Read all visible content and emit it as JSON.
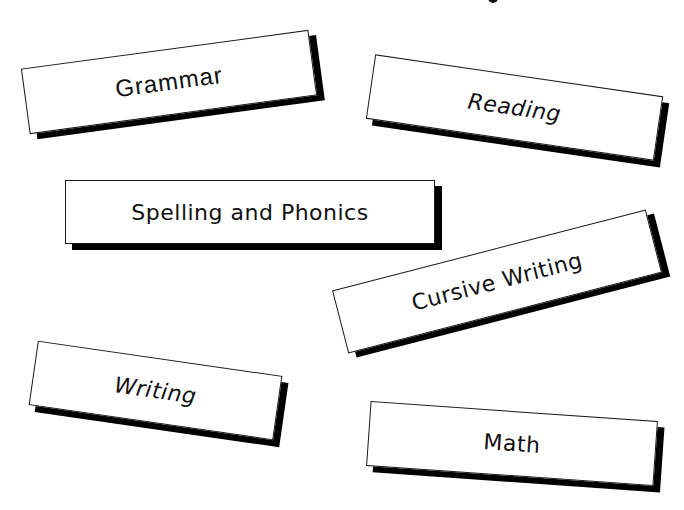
{
  "page": {
    "background": "#ffffff",
    "top_fragment": "cut-off letter descender at top edge"
  },
  "colors": {
    "card_fill": "#ffffff",
    "card_border": "#1a1a1a",
    "card_shadow": "#000000",
    "text": "#111111"
  },
  "cards": [
    {
      "id": "grammar",
      "label": "Grammar",
      "rotation_deg": -7.7
    },
    {
      "id": "reading",
      "label": "Reading",
      "rotation_deg": 8.3
    },
    {
      "id": "spelling",
      "label": "Spelling and Phonics",
      "rotation_deg": 0
    },
    {
      "id": "cursive",
      "label": "Cursive Writing",
      "rotation_deg": -14.5
    },
    {
      "id": "writing",
      "label": "Writing",
      "rotation_deg": 8.2
    },
    {
      "id": "math",
      "label": "Math",
      "rotation_deg": 4
    }
  ]
}
